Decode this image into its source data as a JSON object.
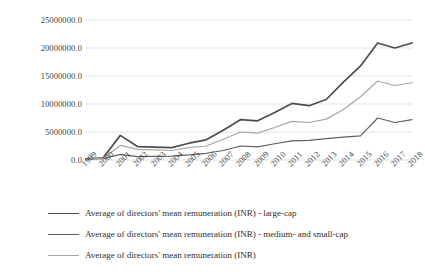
{
  "chart_data": {
    "type": "line",
    "title": "",
    "xlabel": "",
    "ylabel": "",
    "grid": true,
    "legend_position": "bottom-left",
    "ylim": [
      0,
      25000000
    ],
    "ytick_labels": [
      "25000000.0",
      "20000000.0",
      "15000000.0",
      "10000000.0",
      "5000000.0",
      "0.0"
    ],
    "ytick_values": [
      25000000,
      20000000,
      15000000,
      10000000,
      5000000,
      0
    ],
    "categories": [
      "1999",
      "2000",
      "2001",
      "2002",
      "2003",
      "2004",
      "2005",
      "2006",
      "2007",
      "2008",
      "2009",
      "2010",
      "2011",
      "2012",
      "2013",
      "2014",
      "2015",
      "2016",
      "2017",
      "2018"
    ],
    "series": [
      {
        "name": "Average of directors' mean remuneration (INR) - large-cap",
        "color": "#4d4d4d",
        "values": [
          200000,
          400000,
          4400000,
          2400000,
          2300000,
          2200000,
          3000000,
          3600000,
          5300000,
          7200000,
          7000000,
          8500000,
          10100000,
          9700000,
          10800000,
          13900000,
          16800000,
          20900000,
          20000000,
          20900000
        ]
      },
      {
        "name": "Average of directors' mean remuneration (INR) - medium- and small-cap",
        "color": "#5f5f5f",
        "values": [
          150000,
          250000,
          1000000,
          600000,
          650000,
          700000,
          900000,
          1200000,
          1700000,
          2500000,
          2350000,
          2900000,
          3400000,
          3500000,
          3800000,
          4100000,
          4300000,
          7500000,
          6700000,
          7200000
        ]
      },
      {
        "name": "Average of directors' mean remuneration (INR)",
        "color": "#a6a6a6",
        "values": [
          180000,
          320000,
          2600000,
          1900000,
          1800000,
          1700000,
          2200000,
          2500000,
          3700000,
          5000000,
          4800000,
          5800000,
          6900000,
          6700000,
          7300000,
          9000000,
          11300000,
          14100000,
          13300000,
          13800000
        ]
      }
    ]
  },
  "legend": {
    "items": [
      {
        "label": "Average of directors' mean remuneration (INR) - large-cap"
      },
      {
        "label": "Average of directors' mean remuneration (INR) - medium- and small-cap"
      },
      {
        "label": "Average of directors' mean remuneration (INR)"
      }
    ]
  },
  "colors": {
    "large_cap": "#4d4d4d",
    "medium_small_cap": "#5f5f5f",
    "overall": "#a6a6a6",
    "gridline": "#d9d9d9",
    "background": "#ffffff",
    "text": "#3f3f3f"
  }
}
